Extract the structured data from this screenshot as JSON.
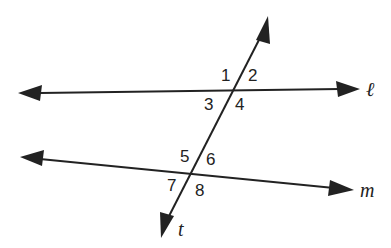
{
  "diagram": {
    "lines": [
      {
        "name": "ℓ",
        "label": "ℓ"
      },
      {
        "name": "m",
        "label": "m"
      },
      {
        "name": "t",
        "label": "t"
      }
    ],
    "angles": [
      "1",
      "2",
      "3",
      "4",
      "5",
      "6",
      "7",
      "8"
    ],
    "colors": {
      "stroke": "#222222",
      "background": "#ffffff"
    }
  }
}
